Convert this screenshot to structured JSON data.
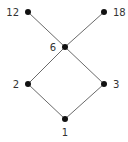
{
  "diagram": {
    "type": "hasse-diagram",
    "colors": {
      "edge": "#6a6a6a",
      "node": "#111111",
      "label": "#333333",
      "background": "#ffffff"
    },
    "nodes": [
      {
        "id": "12",
        "label": "12",
        "x": 28,
        "y": 12,
        "label_pos": "left"
      },
      {
        "id": "18",
        "label": "18",
        "x": 104,
        "y": 12,
        "label_pos": "right"
      },
      {
        "id": "6",
        "label": "6",
        "x": 65,
        "y": 47,
        "label_pos": "left"
      },
      {
        "id": "2",
        "label": "2",
        "x": 28,
        "y": 84,
        "label_pos": "left"
      },
      {
        "id": "3",
        "label": "3",
        "x": 104,
        "y": 84,
        "label_pos": "right"
      },
      {
        "id": "1",
        "label": "1",
        "x": 65,
        "y": 119,
        "label_pos": "below"
      }
    ],
    "edges": [
      {
        "from": "1",
        "to": "2"
      },
      {
        "from": "1",
        "to": "3"
      },
      {
        "from": "2",
        "to": "6"
      },
      {
        "from": "3",
        "to": "6"
      },
      {
        "from": "6",
        "to": "12"
      },
      {
        "from": "6",
        "to": "18"
      }
    ]
  }
}
